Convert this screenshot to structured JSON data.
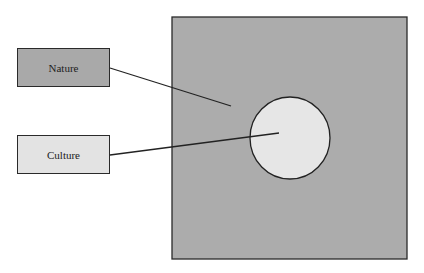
{
  "diagram": {
    "labels": {
      "nature": "Nature",
      "culture": "Culture"
    },
    "colors": {
      "nature_fill": "#a9a9a9",
      "culture_fill": "#e3e3e3",
      "square_fill": "#acacac",
      "circle_fill": "#e6e6e6",
      "stroke": "#222222"
    }
  }
}
